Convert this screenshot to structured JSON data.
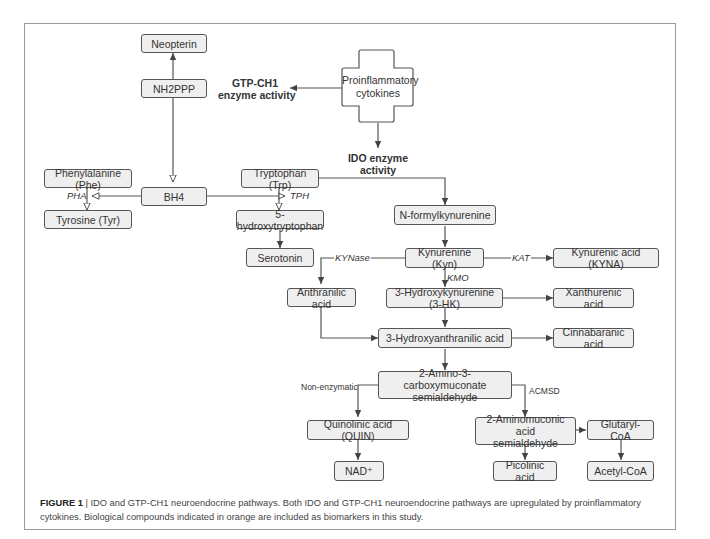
{
  "diagram": {
    "nodes": {
      "neopterin": "Neopterin",
      "nh2ppp": "NH2PPP",
      "bh4": "BH4",
      "phe": "Phenylalanine (Phe)",
      "tyr": "Tyrosine (Tyr)",
      "trp": "Tryptophan (Trp)",
      "htp": "5-hydroxytryptophan",
      "serotonin": "Serotonin",
      "nfk": "N-formylkynurenine",
      "kyn": "Kynurenine (Kyn)",
      "kyna": "Kynurenic acid (KYNA)",
      "anthranilic": "Anthranilic acid",
      "hk": "3-Hydroxykynurenine (3-HK)",
      "xanthurenic": "Xanthurenic acid",
      "haa": "3-Hydroxyanthranilic acid",
      "cinnabaranic": "Cinnabaranic acid",
      "acms_1": "2-Amino-3-carboxymuconate",
      "acms_2": "semialdehyde",
      "quin": "Quinolinic acid (QUIN)",
      "nad": "NAD⁺",
      "ams_1": "2-Aminomuconic acid",
      "ams_2": "semialdehyde",
      "glutaryl": "Glutaryl-CoA",
      "picolinic": "Picolinic acid",
      "acetyl": "Acetyl-CoA",
      "cytokines_1": "Proinflammatory",
      "cytokines_2": "cytokines"
    },
    "labels": {
      "gtp_1": "GTP-CH1",
      "gtp_2": "enzyme activity",
      "ido_1": "IDO enzyme",
      "ido_2": "activity",
      "pha": "PHA",
      "tph": "TPH",
      "kynase": "KYNase",
      "kat": "KAT",
      "kmo": "KMO",
      "non_enzymatic": "Non-enzymatic",
      "acmsd": "ACMSD"
    }
  },
  "caption": {
    "figure_label": "FIGURE 1",
    "separator": " | ",
    "text": "IDO and GTP-CH1 neuroendocrine pathways. Both IDO and GTP-CH1 neuroendocrine pathways are upregulated by proinflammatory cytokines. Biological compounds indicated in orange are included as biomarkers in this study."
  },
  "colors": {
    "node_fill": "#efefef",
    "node_border": "#555555",
    "line": "#555555",
    "frame": "#9a9a9a"
  }
}
